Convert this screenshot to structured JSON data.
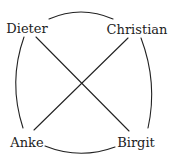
{
  "diagram": {
    "type": "graph",
    "stroke_color": "#222222",
    "background": "#ffffff",
    "nodes": [
      {
        "id": "dieter",
        "label": "Dieter",
        "x": 27,
        "y": 28
      },
      {
        "id": "christian",
        "label": "Christian",
        "x": 137,
        "y": 29
      },
      {
        "id": "anke",
        "label": "Anke",
        "x": 27,
        "y": 142
      },
      {
        "id": "birgit",
        "label": "Birgit",
        "x": 136,
        "y": 142
      }
    ],
    "edges": [
      {
        "from": "dieter",
        "to": "christian",
        "style": "arc"
      },
      {
        "from": "dieter",
        "to": "anke",
        "style": "arc"
      },
      {
        "from": "christian",
        "to": "birgit",
        "style": "arc"
      },
      {
        "from": "anke",
        "to": "birgit",
        "style": "arc"
      },
      {
        "from": "dieter",
        "to": "birgit",
        "style": "straight"
      },
      {
        "from": "christian",
        "to": "anke",
        "style": "straight"
      }
    ]
  }
}
